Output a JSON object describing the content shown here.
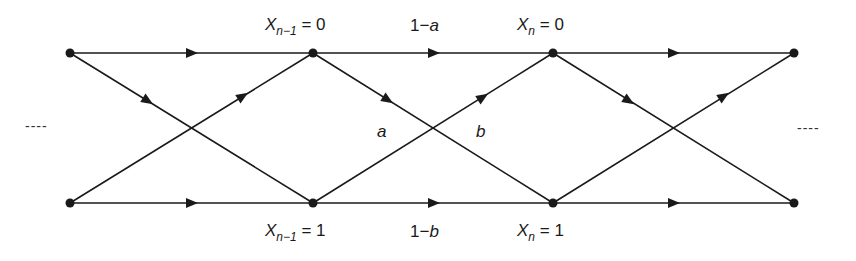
{
  "diagram": {
    "type": "trellis",
    "colors": {
      "stroke": "#1a1a1a",
      "background": "#ffffff"
    },
    "continuation_left": "----",
    "continuation_right": "----",
    "state_labels": {
      "prev_top": {
        "var": "X",
        "sub": "n−1",
        "eq": " = 0"
      },
      "prev_bottom": {
        "var": "X",
        "sub": "n−1",
        "eq": " = 1"
      },
      "curr_top": {
        "var": "X",
        "sub": "n",
        "eq": " = 0"
      },
      "curr_bottom": {
        "var": "X",
        "sub": "n",
        "eq": " = 1"
      }
    },
    "edge_labels": {
      "stay_top": {
        "num": "1−",
        "var": "a"
      },
      "stay_bottom": {
        "num": "1−",
        "var": "b"
      },
      "cross_down": "a",
      "cross_up": "b"
    },
    "nodes": {
      "top": [
        [
          70,
          53
        ],
        [
          313,
          53
        ],
        [
          553,
          53
        ],
        [
          794,
          53
        ]
      ],
      "bottom": [
        [
          70,
          203
        ],
        [
          313,
          203
        ],
        [
          553,
          203
        ],
        [
          794,
          203
        ]
      ]
    }
  }
}
